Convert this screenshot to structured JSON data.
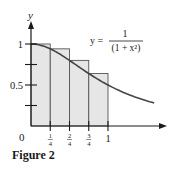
{
  "chart_data": {
    "type": "bar",
    "title": "",
    "caption": "Figure 2",
    "xlabel": "",
    "ylabel": "y",
    "equation": {
      "lhs": "y =",
      "numerator": "1",
      "denominator": "(1 + x²)"
    },
    "categories": [
      "[0, 1/4]",
      "[1/4, 2/4]",
      "[2/4, 3/4]",
      "[3/4, 1]"
    ],
    "bar_left_x": [
      0,
      0.25,
      0.5,
      0.75
    ],
    "bar_width": 0.25,
    "values": [
      1.0,
      0.941,
      0.8,
      0.64
    ],
    "curve": {
      "function": "1/(1+x^2)",
      "x_range": [
        0,
        1.6
      ]
    },
    "x_ticks": [
      {
        "value": 0.25,
        "num": "1",
        "den": "4"
      },
      {
        "value": 0.5,
        "num": "2",
        "den": "4"
      },
      {
        "value": 0.75,
        "num": "3",
        "den": "4"
      },
      {
        "value": 1,
        "label": "1"
      }
    ],
    "y_ticks": [
      {
        "value": 0.25,
        "label": ""
      },
      {
        "value": 0.5,
        "label": "0.5"
      },
      {
        "value": 0.75,
        "label": ""
      },
      {
        "value": 1,
        "label": "1"
      }
    ],
    "origin_label": "0",
    "xlim": [
      0,
      1.75
    ],
    "ylim": [
      0,
      1.25
    ],
    "grid": false,
    "legend": "none",
    "colors": {
      "bar_fill": "#e6e6e6",
      "bar_stroke": "#555555",
      "curve": "#444444",
      "axis": "#1a1a1a"
    }
  }
}
